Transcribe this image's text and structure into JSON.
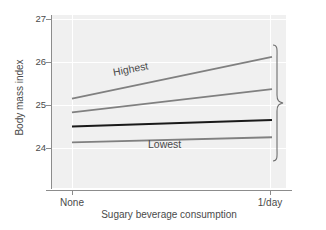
{
  "chart_data": {
    "type": "line",
    "title": "",
    "xlabel": "Sugary beverage consumption",
    "ylabel": "Body mass index",
    "x": [
      "None",
      "1/day"
    ],
    "xticklabels": [
      "None",
      "1/day"
    ],
    "yticklabels": [
      "27",
      "26",
      "25",
      "24"
    ],
    "ytickvalues": [
      27,
      26,
      25,
      24
    ],
    "ylim": [
      23.55,
      27.0
    ],
    "grid": "horizontal-and-vertical-white-on-gray",
    "legend": "inline-labels",
    "annotation_right": "Quartiles of genetic risk of obesity",
    "series": [
      {
        "name": "Highest",
        "label": "Highest",
        "color": "#808080",
        "width": 1.8,
        "values": [
          25.15,
          26.12
        ]
      },
      {
        "name": "Third quartile",
        "label": "",
        "color": "#808080",
        "width": 1.8,
        "values": [
          24.83,
          25.37
        ]
      },
      {
        "name": "Second quartile",
        "label": "",
        "color": "#1a1a1a",
        "width": 2.0,
        "values": [
          24.5,
          24.65
        ]
      },
      {
        "name": "Lowest",
        "label": "Lowest",
        "color": "#808080",
        "width": 1.8,
        "values": [
          24.13,
          24.25
        ]
      }
    ]
  },
  "axes": {
    "y_title": "Body mass index",
    "x_title": "Sugary beverage consumption",
    "y_ticks": [
      {
        "label": "27"
      },
      {
        "label": "26"
      },
      {
        "label": "25"
      },
      {
        "label": "24"
      }
    ],
    "x_ticks": [
      {
        "label": "None"
      },
      {
        "label": "1/day"
      }
    ]
  },
  "labels": {
    "highest": "Highest",
    "lowest": "Lowest",
    "quartiles": "Quartiles of genetic risk of obesity"
  },
  "colors": {
    "panel_background": "#f0f0f0",
    "page_background": "#ffffff",
    "axis": "#8c8c8c",
    "gridline": "#ffffff",
    "series_gray": "#808080",
    "series_black": "#1a1a1a",
    "text": "#4a4a4a"
  }
}
